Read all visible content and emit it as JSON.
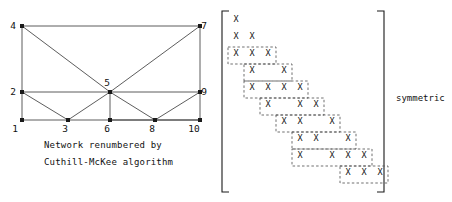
{
  "figure": {
    "caption_line1": "Network renumbered by",
    "caption_line2": "Cuthill-McKee algorithm",
    "symmetric_label": "symmetric",
    "cell_mark": "X"
  },
  "network": {
    "title": "Cuthill-McKee renumbered network",
    "nodes": [
      {
        "id": "1",
        "x": 22,
        "y": 120,
        "label_dx": -7,
        "label_dy": 12
      },
      {
        "id": "2",
        "x": 22,
        "y": 92,
        "label_dx": -9,
        "label_dy": 3
      },
      {
        "id": "3",
        "x": 68,
        "y": 120,
        "label_dx": -3,
        "label_dy": 12
      },
      {
        "id": "4",
        "x": 22,
        "y": 26,
        "label_dx": -9,
        "label_dy": 3
      },
      {
        "id": "5",
        "x": 110,
        "y": 92,
        "label_dx": -3,
        "label_dy": -6
      },
      {
        "id": "6",
        "x": 110,
        "y": 120,
        "label_dx": -3,
        "label_dy": 12
      },
      {
        "id": "7",
        "x": 200,
        "y": 26,
        "label_dx": 4,
        "label_dy": 3
      },
      {
        "id": "8",
        "x": 155,
        "y": 120,
        "label_dx": -3,
        "label_dy": 12
      },
      {
        "id": "9",
        "x": 200,
        "y": 92,
        "label_dx": 4,
        "label_dy": 3
      },
      {
        "id": "10",
        "x": 200,
        "y": 120,
        "label_dx": -6,
        "label_dy": 12
      }
    ],
    "edges": [
      [
        "1",
        "2"
      ],
      [
        "1",
        "3"
      ],
      [
        "2",
        "4"
      ],
      [
        "2",
        "3"
      ],
      [
        "2",
        "5"
      ],
      [
        "4",
        "7"
      ],
      [
        "4",
        "5"
      ],
      [
        "3",
        "6"
      ],
      [
        "3",
        "5"
      ],
      [
        "5",
        "6"
      ],
      [
        "5",
        "7"
      ],
      [
        "5",
        "8"
      ],
      [
        "5",
        "9"
      ],
      [
        "6",
        "8"
      ],
      [
        "7",
        "9"
      ],
      [
        "8",
        "9"
      ],
      [
        "8",
        "10"
      ],
      [
        "9",
        "10"
      ],
      [
        "6",
        "10"
      ]
    ]
  },
  "matrix": {
    "size": 10,
    "origin_x": 232,
    "origin_y": 16,
    "col_w": 16,
    "row_h": 17,
    "bracket_left_x": 222,
    "bracket_right_x": 384,
    "bracket_top_y": 11,
    "bracket_bottom_y": 192,
    "bracket_tick": 7,
    "entries": [
      {
        "r": 1,
        "c": 1
      },
      {
        "r": 2,
        "c": 1
      },
      {
        "r": 2,
        "c": 2
      },
      {
        "r": 3,
        "c": 1
      },
      {
        "r": 3,
        "c": 2
      },
      {
        "r": 3,
        "c": 3
      },
      {
        "r": 4,
        "c": 2
      },
      {
        "r": 4,
        "c": 4
      },
      {
        "r": 5,
        "c": 2
      },
      {
        "r": 5,
        "c": 3
      },
      {
        "r": 5,
        "c": 4
      },
      {
        "r": 5,
        "c": 5
      },
      {
        "r": 6,
        "c": 3
      },
      {
        "r": 6,
        "c": 5
      },
      {
        "r": 6,
        "c": 6
      },
      {
        "r": 7,
        "c": 4
      },
      {
        "r": 7,
        "c": 5
      },
      {
        "r": 7,
        "c": 7
      },
      {
        "r": 8,
        "c": 5
      },
      {
        "r": 8,
        "c": 6
      },
      {
        "r": 8,
        "c": 8
      },
      {
        "r": 9,
        "c": 5
      },
      {
        "r": 9,
        "c": 7
      },
      {
        "r": 9,
        "c": 8
      },
      {
        "r": 9,
        "c": 9
      },
      {
        "r": 10,
        "c": 8
      },
      {
        "r": 10,
        "c": 9
      },
      {
        "r": 10,
        "c": 10
      }
    ],
    "band_outline": [
      {
        "r": 3,
        "c0": 1,
        "c1": 3
      },
      {
        "r": 4,
        "c0": 2,
        "c1": 4
      },
      {
        "r": 5,
        "c0": 2,
        "c1": 5
      },
      {
        "r": 6,
        "c0": 3,
        "c1": 6
      },
      {
        "r": 7,
        "c0": 4,
        "c1": 7
      },
      {
        "r": 8,
        "c0": 5,
        "c1": 8
      },
      {
        "r": 9,
        "c0": 5,
        "c1": 9
      },
      {
        "r": 10,
        "c0": 8,
        "c1": 10
      }
    ]
  },
  "colors": {
    "ink": "#1a1a1a",
    "line": "#333333",
    "dash": "#555555",
    "background": "#ffffff"
  }
}
